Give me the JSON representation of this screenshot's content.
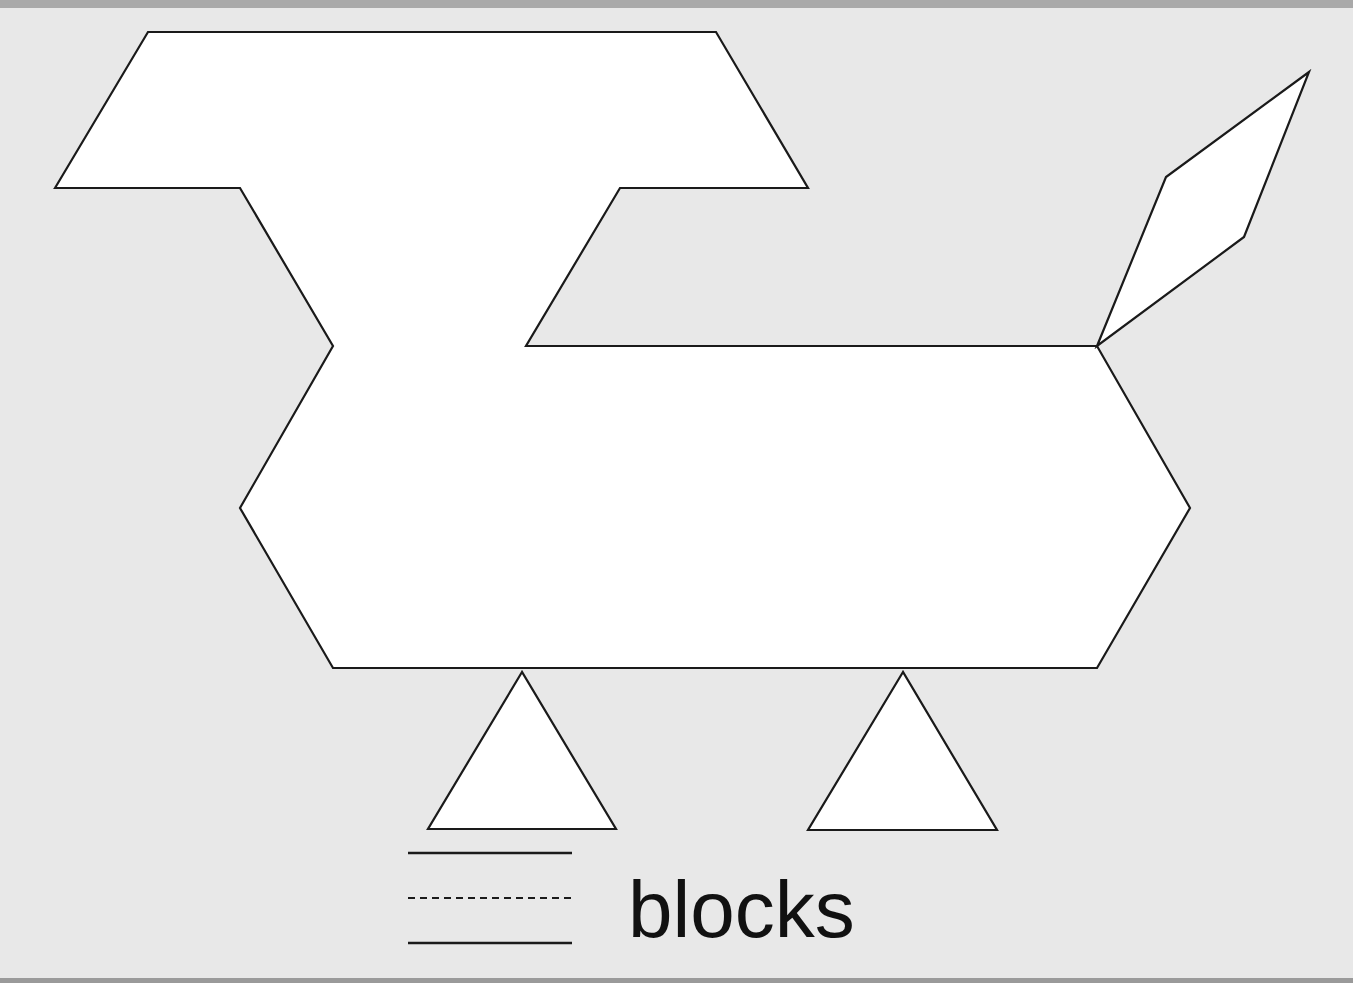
{
  "worksheet": {
    "answer_label": "blocks",
    "figure": "pattern-block bird",
    "colors": {
      "background": "#e8e8e8",
      "shape_fill": "#ffffff",
      "stroke": "#1a1a1a",
      "top_bar": "#a9a9a9"
    },
    "shapes": {
      "body_outline": "55,188 148,32 716,32 808,188 620,188 526,346 1097,346 1190,508 1097,668 333,668 240,508 333,346 240,188",
      "tail_rhombus": "1097,346 1166,177 1309,72 1244,237",
      "left_leg_triangle": "522,672 428,829 616,829",
      "right_leg_triangle": "903,672 808,830 997,830"
    },
    "writing_lines": [
      {
        "style": "solid",
        "y": 853
      },
      {
        "style": "dashed",
        "y": 898
      },
      {
        "style": "solid",
        "y": 943
      }
    ]
  }
}
